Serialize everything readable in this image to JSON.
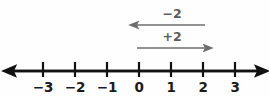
{
  "figure": {
    "width": 269,
    "height": 98,
    "background_color": "#fefefe"
  },
  "chart_data": {
    "type": "line",
    "xlabel": "",
    "ylabel": "",
    "xlim": [
      -3.95,
      3.75
    ],
    "grid": false,
    "legend_position": "none",
    "axis": {
      "name": "number-line",
      "color": "#111111",
      "stroke_width": 2.6,
      "y_position": 71,
      "left_arrow": true,
      "right_arrow": true,
      "start_x": 12,
      "end_x": 259
    },
    "ticks": [
      {
        "value": -3,
        "label": "−3",
        "x": 43
      },
      {
        "value": -2,
        "label": "−2",
        "x": 75
      },
      {
        "value": -1,
        "label": "−1",
        "x": 107
      },
      {
        "value": 0,
        "label": "0",
        "x": 139
      },
      {
        "value": 1,
        "label": "1",
        "x": 171
      },
      {
        "value": 2,
        "label": "2",
        "x": 203
      },
      {
        "value": 3,
        "label": "3",
        "x": 235
      }
    ],
    "tick_label_y": 81,
    "annotations": [
      {
        "name": "minus-two-jump",
        "label": "−2",
        "value": -2,
        "direction": "left",
        "from_value": 2,
        "to_value": 0,
        "from_x": 205,
        "to_x": 137,
        "y": 25,
        "label_x": 172,
        "label_y": 8,
        "color": "#6e6e6e"
      },
      {
        "name": "plus-two-jump",
        "label": "+2",
        "value": 2,
        "direction": "right",
        "from_value": 0,
        "to_value": 2,
        "from_x": 137,
        "to_x": 205,
        "y": 48,
        "label_x": 172,
        "label_y": 31,
        "color": "#6e6e6e"
      }
    ],
    "colors": {
      "axis": "#111111",
      "tick_label": "#1a1a1a",
      "jump_arrow": "#6e6e6e",
      "jump_label": "#5b5b5b"
    }
  }
}
